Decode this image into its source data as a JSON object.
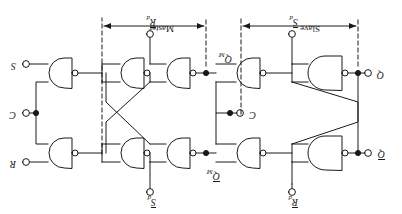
{
  "figure": {
    "orientation_degrees": 180,
    "background_color": "#ffffff",
    "line_color": "#1a1a1a"
  },
  "terminals": {
    "q_bar": "Q",
    "q": "Q",
    "r_d": "R",
    "s_d": "S",
    "r_out": "R",
    "c_out": "C",
    "s_out": "S",
    "c_mid": "C",
    "q_m_bar": "Q",
    "q_m": "Q",
    "sub_d": "d",
    "sub_m": "M"
  },
  "sections": {
    "slave": "Slave",
    "master": "Master"
  },
  "gates": [
    {
      "id": "g1",
      "name": "slave-nand-top",
      "type": "nand",
      "inverted_output": true
    },
    {
      "id": "g2",
      "name": "slave-nand-bottom",
      "type": "nand",
      "inverted_output": true
    },
    {
      "id": "g3",
      "name": "slave-input-nand-top",
      "type": "nand",
      "inverted_output": true
    },
    {
      "id": "g4",
      "name": "slave-input-nand-bottom",
      "type": "nand",
      "inverted_output": true
    },
    {
      "id": "g5",
      "name": "master-nand-top",
      "type": "nand",
      "inverted_output": true
    },
    {
      "id": "g6",
      "name": "master-nand-bottom",
      "type": "nand",
      "inverted_output": true
    },
    {
      "id": "g7",
      "name": "master-input-nand-top",
      "type": "nand",
      "inverted_output": true
    },
    {
      "id": "g8",
      "name": "master-input-nand-bottom",
      "type": "nand",
      "inverted_output": true
    }
  ]
}
